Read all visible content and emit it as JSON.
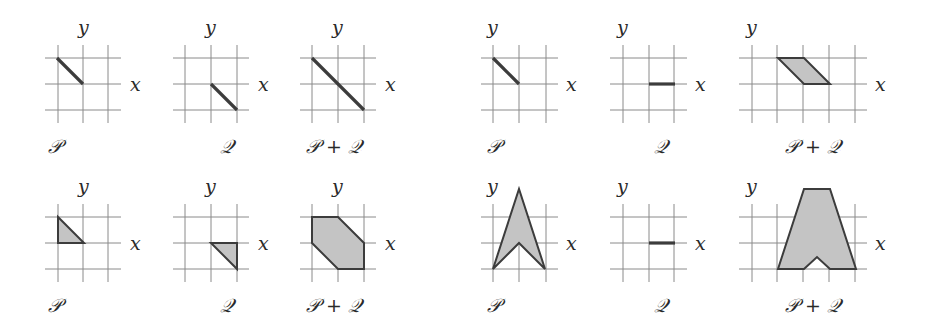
{
  "figure": {
    "width": 929,
    "height": 330,
    "unit_px": 26,
    "colors": {
      "grid": "#8a8a8a",
      "fill": "#c4c4c4",
      "stroke": "#3c3c3c",
      "text": "#2a2a2a"
    },
    "axis_labels": {
      "x": "x",
      "y": "y"
    },
    "panels": [
      {
        "id": "top-left-P",
        "label": "𝒫",
        "origin": [
          83,
          84
        ],
        "vlines": [
          58,
          83,
          108
        ],
        "hlines": [
          58,
          84,
          110
        ],
        "xrange": [
          45,
          121
        ],
        "yrange": [
          45,
          123
        ],
        "label_pos": [
          48,
          153
        ],
        "xlabel_pos": [
          130,
          91
        ],
        "ylabel_pos": [
          78,
          34
        ],
        "shape": {
          "type": "segment",
          "points": [
            [
              -1,
              1
            ],
            [
              0,
              0
            ]
          ]
        }
      },
      {
        "id": "top-left-Q",
        "label": "𝒬",
        "origin": [
          211,
          84
        ],
        "vlines": [
          185,
          211,
          237
        ],
        "hlines": [
          58,
          84,
          110
        ],
        "xrange": [
          173,
          249
        ],
        "yrange": [
          45,
          123
        ],
        "label_pos": [
          220,
          153
        ],
        "xlabel_pos": [
          258,
          91
        ],
        "ylabel_pos": [
          205,
          34
        ],
        "shape": {
          "type": "segment",
          "points": [
            [
              0,
              0
            ],
            [
              1,
              -1
            ]
          ]
        }
      },
      {
        "id": "top-left-PQ",
        "label": "𝒫 + 𝒬",
        "origin": [
          338,
          84
        ],
        "vlines": [
          312,
          338,
          364
        ],
        "hlines": [
          58,
          84,
          110
        ],
        "xrange": [
          300,
          376
        ],
        "yrange": [
          45,
          123
        ],
        "label_pos": [
          306,
          153
        ],
        "xlabel_pos": [
          385,
          91
        ],
        "ylabel_pos": [
          332,
          34
        ],
        "shape": {
          "type": "segment",
          "points": [
            [
              -1,
              1
            ],
            [
              1,
              -1
            ]
          ]
        }
      },
      {
        "id": "top-right-P",
        "label": "𝒫",
        "origin": [
          493,
          84
        ],
        "vlines": [
          493,
          519,
          546
        ],
        "hlines": [
          58,
          84,
          110
        ],
        "xrange": [
          481,
          558
        ],
        "yrange": [
          45,
          123
        ],
        "label_pos": [
          487,
          153
        ],
        "xlabel_pos": [
          566,
          91
        ],
        "ylabel_pos": [
          487,
          34
        ],
        "shape": {
          "type": "segment",
          "points": [
            [
              0,
              1
            ],
            [
              1,
              0
            ]
          ]
        }
      },
      {
        "id": "top-right-Q",
        "label": "𝒬",
        "origin": [
          623,
          84
        ],
        "vlines": [
          623,
          649,
          674
        ],
        "hlines": [
          58,
          84,
          110
        ],
        "xrange": [
          610,
          687
        ],
        "yrange": [
          45,
          123
        ],
        "label_pos": [
          654,
          153
        ],
        "xlabel_pos": [
          695,
          91
        ],
        "ylabel_pos": [
          617,
          34
        ],
        "shape": {
          "type": "segment",
          "points": [
            [
              1,
              0
            ],
            [
              2,
              0
            ]
          ]
        }
      },
      {
        "id": "top-right-PQ",
        "label": "𝒫 + 𝒬",
        "origin": [
          752,
          84
        ],
        "vlines": [
          752,
          777,
          803,
          829,
          855
        ],
        "hlines": [
          58,
          84,
          110
        ],
        "xrange": [
          739,
          867
        ],
        "yrange": [
          45,
          123
        ],
        "label_pos": [
          785,
          153
        ],
        "xlabel_pos": [
          875,
          91
        ],
        "ylabel_pos": [
          746,
          34
        ],
        "shape": {
          "type": "polygon",
          "points": [
            [
              1,
              1
            ],
            [
              2,
              1
            ],
            [
              3,
              0
            ],
            [
              2,
              0
            ]
          ]
        }
      },
      {
        "id": "bottom-left-P",
        "label": "𝒫",
        "origin": [
          58,
          243
        ],
        "vlines": [
          58,
          83,
          108
        ],
        "hlines": [
          217,
          243,
          269
        ],
        "xrange": [
          45,
          121
        ],
        "yrange": [
          204,
          282
        ],
        "label_pos": [
          48,
          312
        ],
        "xlabel_pos": [
          130,
          250
        ],
        "ylabel_pos": [
          78,
          193
        ],
        "shape": {
          "type": "polygon",
          "points": [
            [
              0,
              1
            ],
            [
              0,
              0
            ],
            [
              1,
              0
            ]
          ]
        }
      },
      {
        "id": "bottom-left-Q",
        "label": "𝒬",
        "origin": [
          211,
          243
        ],
        "vlines": [
          185,
          211,
          237
        ],
        "hlines": [
          217,
          243,
          269
        ],
        "xrange": [
          173,
          249
        ],
        "yrange": [
          204,
          282
        ],
        "label_pos": [
          220,
          312
        ],
        "xlabel_pos": [
          258,
          250
        ],
        "ylabel_pos": [
          205,
          193
        ],
        "shape": {
          "type": "polygon",
          "points": [
            [
              0,
              0
            ],
            [
              1,
              0
            ],
            [
              1,
              -1
            ]
          ]
        }
      },
      {
        "id": "bottom-left-PQ",
        "label": "𝒫 + 𝒬",
        "origin": [
          338,
          243
        ],
        "vlines": [
          312,
          338,
          364
        ],
        "hlines": [
          217,
          243,
          269
        ],
        "xrange": [
          300,
          376
        ],
        "yrange": [
          204,
          282
        ],
        "label_pos": [
          306,
          312
        ],
        "xlabel_pos": [
          385,
          250
        ],
        "ylabel_pos": [
          332,
          193
        ],
        "shape": {
          "type": "polygon",
          "points": [
            [
              -1,
              1
            ],
            [
              0,
              1
            ],
            [
              1,
              0
            ],
            [
              1,
              -1
            ],
            [
              0,
              -1
            ],
            [
              -1,
              0
            ]
          ]
        }
      },
      {
        "id": "bottom-right-P",
        "label": "𝒫",
        "origin": [
          493,
          243
        ],
        "vlines": [
          493,
          519,
          546
        ],
        "hlines": [
          217,
          243,
          269
        ],
        "xrange": [
          481,
          558
        ],
        "yrange": [
          204,
          282
        ],
        "label_pos": [
          487,
          312
        ],
        "xlabel_pos": [
          566,
          250
        ],
        "ylabel_pos": [
          487,
          193
        ],
        "shape": {
          "type": "polygon",
          "points": [
            [
              0,
              -1
            ],
            [
              1,
              2.08
            ],
            [
              2,
              -1
            ],
            [
              1,
              0
            ]
          ]
        }
      },
      {
        "id": "bottom-right-Q",
        "label": "𝒬",
        "origin": [
          623,
          243
        ],
        "vlines": [
          623,
          649,
          674
        ],
        "hlines": [
          217,
          243,
          269
        ],
        "xrange": [
          610,
          687
        ],
        "yrange": [
          204,
          282
        ],
        "label_pos": [
          654,
          312
        ],
        "xlabel_pos": [
          695,
          250
        ],
        "ylabel_pos": [
          617,
          193
        ],
        "shape": {
          "type": "segment",
          "points": [
            [
              1,
              0
            ],
            [
              2,
              0
            ]
          ]
        }
      },
      {
        "id": "bottom-right-PQ",
        "label": "𝒫 + 𝒬",
        "origin": [
          752,
          243
        ],
        "vlines": [
          752,
          777,
          803,
          829,
          855
        ],
        "hlines": [
          217,
          243,
          269
        ],
        "xrange": [
          739,
          867
        ],
        "yrange": [
          204,
          282
        ],
        "label_pos": [
          785,
          312
        ],
        "xlabel_pos": [
          875,
          250
        ],
        "ylabel_pos": [
          746,
          193
        ],
        "shape": {
          "type": "polygon",
          "points": [
            [
              1,
              -1
            ],
            [
              2,
              2.08
            ],
            [
              3,
              2.08
            ],
            [
              4,
              -1
            ],
            [
              3,
              -1
            ],
            [
              2.5,
              -0.54
            ],
            [
              2,
              -1
            ]
          ]
        }
      }
    ]
  }
}
